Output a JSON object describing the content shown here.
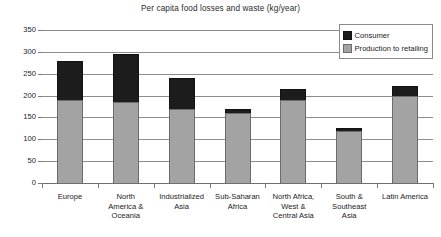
{
  "chart_data": {
    "type": "bar",
    "subtype": "stacked-vertical",
    "title": "Per capita food losses and waste (kg/year)",
    "xlabel": "",
    "ylabel": "",
    "ylim": [
      0,
      350
    ],
    "ytick_step": 50,
    "yticks": [
      350,
      300,
      250,
      200,
      150,
      100,
      50,
      0
    ],
    "grid": true,
    "legend_position": "top-right",
    "categories": [
      "Europe",
      "North America & Oceania",
      "Industrialized Asia",
      "Sub-Saharan Africa",
      "North Africa, West & Central Asia",
      "South & Southeast Asia",
      "Latin America"
    ],
    "category_lines": [
      [
        "Europe"
      ],
      [
        "North",
        "America &",
        "Oceania"
      ],
      [
        "Industrialized",
        "Asia"
      ],
      [
        "Sub-Saharan",
        "Africa"
      ],
      [
        "North Africa,",
        "West &",
        "Central Asia"
      ],
      [
        "South &",
        "Southeast",
        "Asia"
      ],
      [
        "Latin America"
      ]
    ],
    "series": [
      {
        "name": "Production to retailing",
        "color": "#a3a3a3",
        "values": [
          190,
          185,
          170,
          160,
          190,
          118,
          200
        ]
      },
      {
        "name": "Consumer",
        "color": "#1c1c1c",
        "values": [
          90,
          110,
          70,
          10,
          25,
          7,
          23
        ]
      }
    ],
    "totals": [
      280,
      295,
      240,
      170,
      215,
      125,
      223
    ]
  },
  "legend": {
    "entries": [
      {
        "label": "Consumer",
        "swatch": "black-square-swatch"
      },
      {
        "label": "Production to retailing",
        "swatch": "gray-square-swatch"
      }
    ]
  }
}
